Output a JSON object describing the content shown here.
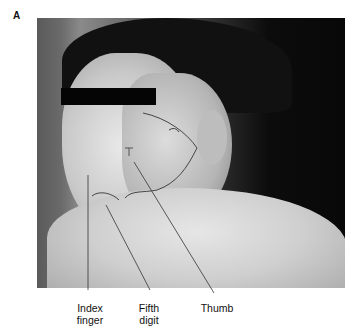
{
  "figure": {
    "panel_label": "A",
    "image_description": "Photograph of a young man's face with drawn outlines on cheek and chin; eyes covered by black censor bar",
    "labels": [
      {
        "id": "index",
        "lines": [
          "Index",
          "finger"
        ]
      },
      {
        "id": "fifth",
        "lines": [
          "Fifth",
          "digit"
        ]
      },
      {
        "id": "thumb",
        "lines": [
          "Thumb"
        ]
      }
    ]
  }
}
